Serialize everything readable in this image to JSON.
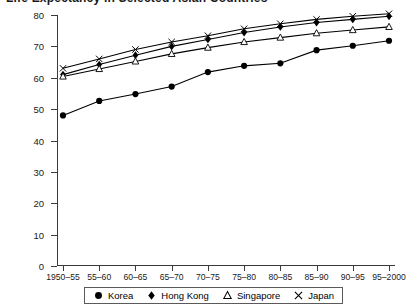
{
  "chart_data": {
    "type": "line",
    "title": "Life Expectancy in Selected Asian Countries",
    "xlabel": "",
    "ylabel": "",
    "ylim": [
      0,
      80
    ],
    "yticks": [
      0,
      10,
      20,
      30,
      40,
      50,
      60,
      70,
      80
    ],
    "grid": false,
    "legend_position": "bottom",
    "categories": [
      "1950–55",
      "55–60",
      "60–65",
      "65–70",
      "70–75",
      "75–80",
      "80–85",
      "85–90",
      "90–95",
      "95–2000"
    ],
    "series": [
      {
        "name": "Korea",
        "marker": "filled-circle",
        "color": "#000000",
        "values": [
          48.0,
          52.6,
          54.8,
          57.2,
          61.8,
          63.8,
          64.6,
          68.8,
          70.2,
          71.8
        ]
      },
      {
        "name": "Hong Kong",
        "marker": "filled-diamond",
        "color": "#000000",
        "values": [
          61.0,
          64.2,
          67.2,
          70.0,
          72.2,
          74.4,
          76.2,
          77.6,
          78.6,
          79.6
        ]
      },
      {
        "name": "Singapore",
        "marker": "open-triangle",
        "color": "#000000",
        "values": [
          60.4,
          62.8,
          65.2,
          67.6,
          69.6,
          71.4,
          72.8,
          74.2,
          75.2,
          76.2
        ]
      },
      {
        "name": "Japan",
        "marker": "cross",
        "color": "#000000",
        "values": [
          63.0,
          66.0,
          69.0,
          71.4,
          73.4,
          75.6,
          77.2,
          78.6,
          79.6,
          80.4
        ]
      }
    ]
  }
}
